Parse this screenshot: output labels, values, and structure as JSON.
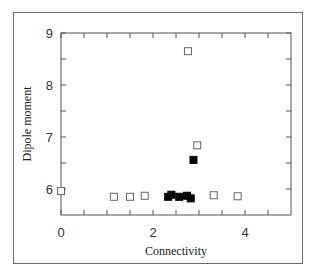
{
  "chart_data": {
    "type": "scatter",
    "title": "",
    "xlabel": "Connectivity",
    "ylabel": "Dipole moment",
    "xlim": [
      0,
      5
    ],
    "ylim": [
      5.5,
      9
    ],
    "x_ticks": [
      0,
      2,
      4
    ],
    "x_minor_ticks": [
      0.5,
      1,
      1.5,
      2.5,
      3,
      3.5,
      4.5
    ],
    "y_ticks": [
      6,
      7,
      8,
      9
    ],
    "y_minor_ticks": [
      6.5,
      7.5,
      8.5
    ],
    "grid": false,
    "legend": null,
    "series": [
      {
        "name": "open",
        "marker": "open-square",
        "color": "#555555",
        "points": [
          {
            "x": 0.0,
            "y": 5.96
          },
          {
            "x": 1.15,
            "y": 5.85
          },
          {
            "x": 1.5,
            "y": 5.85
          },
          {
            "x": 1.82,
            "y": 5.87
          },
          {
            "x": 2.76,
            "y": 8.65
          },
          {
            "x": 2.96,
            "y": 6.84
          },
          {
            "x": 3.32,
            "y": 5.88
          },
          {
            "x": 3.84,
            "y": 5.86
          }
        ]
      },
      {
        "name": "filled",
        "marker": "filled-square",
        "color": "#000000",
        "points": [
          {
            "x": 2.33,
            "y": 5.85
          },
          {
            "x": 2.4,
            "y": 5.89
          },
          {
            "x": 2.57,
            "y": 5.85
          },
          {
            "x": 2.74,
            "y": 5.87
          },
          {
            "x": 2.82,
            "y": 5.82
          },
          {
            "x": 2.88,
            "y": 6.56
          }
        ]
      }
    ]
  }
}
